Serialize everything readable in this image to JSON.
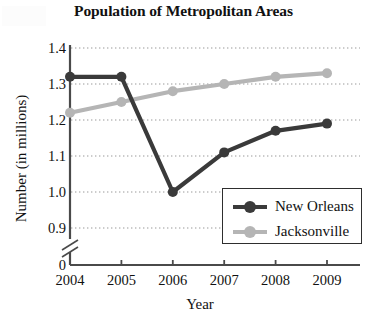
{
  "chart_data": {
    "type": "line",
    "title": "Population of Metropolitan Areas",
    "xlabel": "Year",
    "ylabel": "Number (in millions)",
    "categories": [
      "2004",
      "2005",
      "2006",
      "2007",
      "2008",
      "2009"
    ],
    "x": [
      2004,
      2005,
      2006,
      2007,
      2008,
      2009
    ],
    "series": [
      {
        "name": "New Orleans",
        "color": "#3a3a3a",
        "values": [
          1.32,
          1.32,
          1.0,
          1.11,
          1.17,
          1.19
        ]
      },
      {
        "name": "Jacksonville",
        "color": "#b5b5b5",
        "values": [
          1.22,
          1.25,
          1.28,
          1.3,
          1.32,
          1.33
        ]
      }
    ],
    "ylim": [
      0.9,
      1.4
    ],
    "y_ticks": [
      "1.4",
      "1.3",
      "1.2",
      "1.1",
      "1.0",
      "0.9",
      "0"
    ],
    "y_tick_values": [
      1.4,
      1.3,
      1.2,
      1.1,
      1.0,
      0.9,
      0
    ],
    "axis_break": true,
    "axis_break_note": "y-axis broken between 0.9 and 0",
    "grid": true,
    "grid_style": "dotted-horizontal",
    "legend_position": "bottom-right",
    "legend_entries": [
      "New Orleans",
      "Jacksonville"
    ]
  },
  "legend": {
    "items": [
      {
        "label": "New Orleans"
      },
      {
        "label": "Jacksonville"
      }
    ]
  },
  "colors": {
    "new_orleans": "#3a3a3a",
    "jacksonville": "#b5b5b5",
    "axis": "#4a4a4a",
    "grid": "#9a9a9a",
    "text": "#111111"
  }
}
